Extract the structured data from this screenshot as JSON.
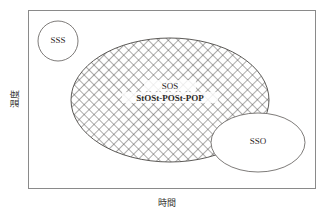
{
  "diagram": {
    "title": "",
    "axes": {
      "y_label": "温度",
      "x_label": "時間"
    },
    "frame": {
      "stroke_color": "#8a8a8a",
      "fill_color": "#ffffff"
    },
    "regions": [
      {
        "name": "sss-circle",
        "label": "SSS",
        "shape": "circle",
        "fill": "#ffffff",
        "stroke": "#6f6c6a",
        "hatched": false
      },
      {
        "name": "sos-ellipse",
        "label": "SOS",
        "sublabel": "StOSt-POSt-POP",
        "shape": "ellipse",
        "fill": "#ffffff",
        "stroke": "#4a4744",
        "hatched": true,
        "hatch_color": "#4a4744"
      },
      {
        "name": "sso-ellipse",
        "label": "SSO",
        "shape": "ellipse",
        "fill": "#ffffff",
        "stroke": "#6f6c6a",
        "hatched": false
      }
    ]
  }
}
